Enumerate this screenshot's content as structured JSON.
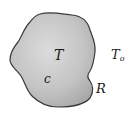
{
  "caption": {
    "visible_text": "",
    "note_clipped": true
  },
  "diagram": {
    "type": "lumped-body",
    "body": {
      "fill_light": "#dedede",
      "fill_dark": "#a8a8a8",
      "stroke": "#3a3a3a"
    },
    "labels": {
      "inside_temperature": "T",
      "inside_capacity": "c",
      "boundary_resistance": "R",
      "ambient_temperature_base": "T",
      "ambient_temperature_sub": "o"
    }
  }
}
